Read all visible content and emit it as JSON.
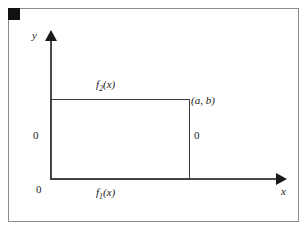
{
  "figure": {
    "corner_marker": "",
    "axes": {
      "y_label": "y",
      "x_label": "x"
    },
    "labels": {
      "upper_boundary": "f",
      "upper_boundary_sub": "2",
      "upper_boundary_arg": "(x)",
      "lower_boundary": "f",
      "lower_boundary_sub": "1",
      "lower_boundary_arg": "(x)",
      "corner_point": "(a, b)",
      "zero_left": "0",
      "zero_right": "0",
      "zero_origin": "0"
    },
    "colors": {
      "frame": "#8c8c8c",
      "axis": "#4a4a4a",
      "rectangle": "#3b3b3b",
      "marker": "#111111",
      "text": "#1a1a1a",
      "background": "#ffffff"
    }
  }
}
